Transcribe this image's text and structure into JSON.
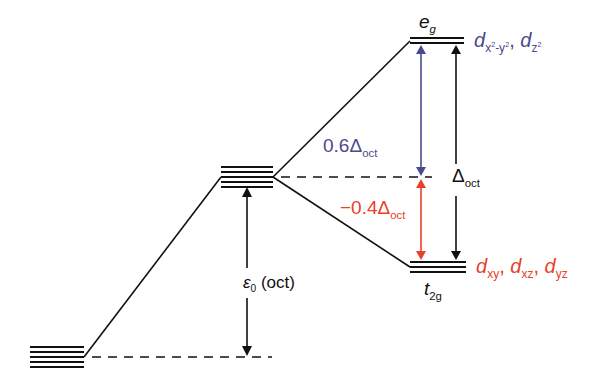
{
  "diagram": {
    "title": "",
    "colors": {
      "line": "#111111",
      "blue": "#4a4a8c",
      "red": "#e8402a"
    },
    "levels": {
      "free_ion": {
        "lines": 5
      },
      "barycenter": {
        "lines": 5
      },
      "eg": {
        "lines": 2,
        "label_main": "e",
        "label_sub": "g"
      },
      "t2g": {
        "lines": 3,
        "label_main": "t",
        "label_sub": "2g"
      }
    },
    "orbital_labels": {
      "eg_orbitals": {
        "d1": "d",
        "d1_sub": "x",
        "d1_sup1": "2",
        "d1_sub2": "-y",
        "d1_sup2": "2",
        "sep": ", ",
        "d2": "d",
        "d2_sub": "z",
        "d2_sup": "2"
      },
      "t2g_orbitals": {
        "d1": "d",
        "d1_sub": "xy",
        "sep1": ", ",
        "d2": "d",
        "d2_sub": "xz",
        "sep2": ", ",
        "d3": "d",
        "d3_sub": "yz"
      }
    },
    "energy_labels": {
      "up": {
        "coef": "0.6",
        "delta": "Δ",
        "sub": "oct"
      },
      "down": {
        "coef": "−0.4",
        "delta": "Δ",
        "sub": "oct"
      },
      "total": {
        "delta": "Δ",
        "sub": "oct"
      },
      "epsilon": {
        "symbol": "ε",
        "sub": "0",
        "text": " (oct)"
      }
    }
  }
}
